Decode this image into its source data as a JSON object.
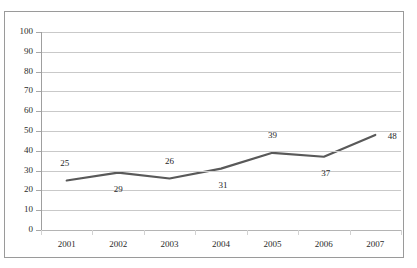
{
  "title_remnant": "",
  "chart_data": {
    "type": "line",
    "title": "",
    "xlabel": "",
    "ylabel": "",
    "categories": [
      "2001",
      "2002",
      "2003",
      "2004",
      "2005",
      "2006",
      "2007"
    ],
    "values": [
      25,
      29,
      26,
      31,
      39,
      37,
      48
    ],
    "series": [
      {
        "name": "",
        "values": [
          25,
          29,
          26,
          31,
          39,
          37,
          48
        ]
      }
    ],
    "data_labels": [
      "25",
      "29",
      "26",
      "31",
      "39",
      "37",
      "48"
    ],
    "ylim": [
      0,
      100
    ],
    "y_ticks": [
      0,
      10,
      20,
      30,
      40,
      50,
      60,
      70,
      80,
      90,
      100
    ],
    "y_tick_labels": [
      "0",
      "10",
      "20",
      "30",
      "40",
      "50",
      "60",
      "70",
      "80",
      "90",
      "100"
    ],
    "grid": true,
    "legend": false,
    "legend_position": "none",
    "line_color": "#595959",
    "grid_color": "#c9c9c9",
    "axis_color": "#9f9f9f",
    "border_color": "#9a9a9a",
    "background_color": "#ffffff",
    "label_color": "#1f1f1f"
  }
}
